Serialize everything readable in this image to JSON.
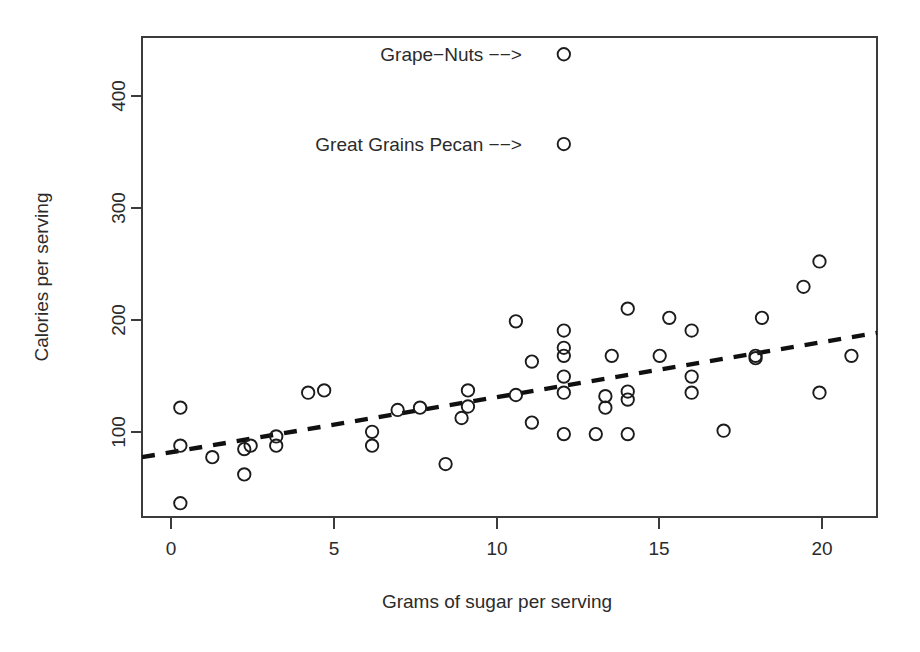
{
  "chart_data": {
    "type": "scatter",
    "title": "",
    "xlabel": "Grams of sugar per serving",
    "ylabel": "Calories per serving",
    "xlim": [
      -1.2,
      21.8
    ],
    "ylim": [
      38,
      455
    ],
    "xticks": [
      0,
      5,
      10,
      15,
      20
    ],
    "xtick_labels": [
      "0",
      "5",
      "10",
      "15",
      "20"
    ],
    "yticks": [
      100,
      200,
      300,
      400
    ],
    "ytick_labels": [
      "100",
      "200",
      "300",
      "400"
    ],
    "grid": false,
    "legend": "none",
    "series": [
      {
        "name": "Cereals",
        "marker": "open-circle",
        "points": [
          [
            0.0,
            50
          ],
          [
            0.0,
            100
          ],
          [
            0.0,
            133
          ],
          [
            1.0,
            90
          ],
          [
            2.0,
            75
          ],
          [
            2.0,
            97
          ],
          [
            2.2,
            100
          ],
          [
            3.0,
            100
          ],
          [
            3.0,
            108
          ],
          [
            4.0,
            146
          ],
          [
            4.5,
            148
          ],
          [
            6.0,
            100
          ],
          [
            6.0,
            112
          ],
          [
            6.8,
            131
          ],
          [
            7.5,
            133
          ],
          [
            8.3,
            84
          ],
          [
            8.8,
            124
          ],
          [
            9.0,
            134
          ],
          [
            9.0,
            148
          ],
          [
            10.5,
            144
          ],
          [
            10.5,
            208
          ],
          [
            11.0,
            120
          ],
          [
            11.0,
            173
          ],
          [
            12.0,
            110
          ],
          [
            12.0,
            146
          ],
          [
            12.0,
            160
          ],
          [
            12.0,
            178
          ],
          [
            12.0,
            185
          ],
          [
            12.0,
            200
          ],
          [
            12.0,
            362
          ],
          [
            12.0,
            440
          ],
          [
            13.0,
            110
          ],
          [
            13.3,
            133
          ],
          [
            13.3,
            143
          ],
          [
            13.5,
            178
          ],
          [
            14.0,
            110
          ],
          [
            14.0,
            140
          ],
          [
            14.0,
            147
          ],
          [
            14.0,
            219
          ],
          [
            15.0,
            178
          ],
          [
            15.3,
            211
          ],
          [
            16.0,
            146
          ],
          [
            16.0,
            160
          ],
          [
            16.0,
            200
          ],
          [
            17.0,
            113
          ],
          [
            18.0,
            176
          ],
          [
            18.0,
            178
          ],
          [
            18.2,
            211
          ],
          [
            19.5,
            238
          ],
          [
            20.0,
            146
          ],
          [
            20.0,
            260
          ],
          [
            21.0,
            178
          ]
        ]
      }
    ],
    "trend_line": {
      "type": "dashed-fit",
      "x_start": -1.2,
      "y_start": 90,
      "x_end": 21.8,
      "y_end": 198
    },
    "annotations": [
      {
        "id": "grape-nuts",
        "text": "Grape−Nuts −−>",
        "anchor_x": 12.0,
        "anchor_y": 440
      },
      {
        "id": "great-grains-pecan",
        "text": "Great Grains Pecan −−>",
        "anchor_x": 12.0,
        "anchor_y": 362
      }
    ]
  },
  "figure": {
    "x_axis_title": "Grams of sugar per serving",
    "y_axis_title": "Calories per serving",
    "xtick_labels": [
      "0",
      "5",
      "10",
      "15",
      "20"
    ],
    "ytick_labels": [
      "100",
      "200",
      "300",
      "400"
    ],
    "annotation_grape_nuts": "Grape−Nuts −−>",
    "annotation_great_grains": "Great Grains Pecan −−>",
    "colors": {
      "background": "#ffffff",
      "frame": "#3b3b3b",
      "marker": "#1c1c1c",
      "trend": "#101010",
      "text": "#2b2b2b"
    }
  }
}
